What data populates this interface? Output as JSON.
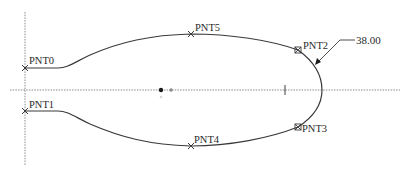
{
  "sketch": {
    "colors": {
      "background": "#ffffff",
      "geometry": "#3a3a3a",
      "centerline": "#8a8a8a",
      "point_dark": "#1a1a1a",
      "point_light": "#8c8c8c"
    },
    "points": [
      {
        "id": "PNT0",
        "label": "PNT0",
        "x": 25,
        "y": 68,
        "marker": "x"
      },
      {
        "id": "PNT1",
        "label": "PNT1",
        "x": 25,
        "y": 111,
        "marker": "x"
      },
      {
        "id": "PNT5",
        "label": "PNT5",
        "x": 191,
        "y": 34,
        "marker": "x"
      },
      {
        "id": "PNT4",
        "label": "PNT4",
        "x": 191,
        "y": 146,
        "marker": "x"
      },
      {
        "id": "PNT2",
        "label": "PNT2",
        "x": 298,
        "y": 50,
        "marker": "box"
      },
      {
        "id": "PNT3",
        "label": "PNT3",
        "x": 298,
        "y": 127,
        "marker": "box"
      }
    ],
    "dimension": {
      "value": "38.00",
      "type": "radius"
    }
  }
}
